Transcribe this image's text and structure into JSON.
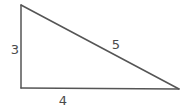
{
  "diagram": {
    "type": "right-triangle",
    "stroke_color": "#555555",
    "label_color": "#4a4a4a",
    "vertices": {
      "top_left": [
        21,
        5
      ],
      "bottom_left": [
        21,
        88
      ],
      "bottom_right": [
        179,
        89
      ]
    },
    "sides": [
      {
        "name": "vertical-leg",
        "label": "3",
        "label_pos": [
          15,
          49
        ]
      },
      {
        "name": "horizontal-leg",
        "label": "4",
        "label_pos": [
          63,
          100
        ]
      },
      {
        "name": "hypotenuse",
        "label": "5",
        "label_pos": [
          116,
          44
        ]
      }
    ]
  }
}
